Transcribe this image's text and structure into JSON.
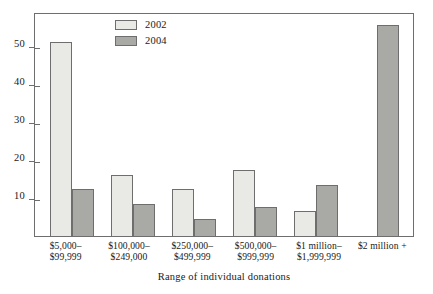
{
  "chart_data": {
    "type": "bar",
    "title": "",
    "xlabel": "Range of individual donations",
    "ylabel": "",
    "categories": [
      "$5,000–$99,999",
      "$100,000–$249,000",
      "$250,000–$499,999",
      "$500,000–$999,999",
      "$1 million–$1,999,999",
      "$2 million +"
    ],
    "category_lines": [
      [
        "$5,000–",
        "$99,999"
      ],
      [
        "$100,000–",
        "$249,000"
      ],
      [
        "$250,000–",
        "$499,999"
      ],
      [
        "$500,000–",
        "$999,999"
      ],
      [
        "$1 million–",
        "$1,999,999"
      ],
      [
        "$2 million +",
        ""
      ]
    ],
    "series": [
      {
        "name": "2002",
        "color": "#e9e9e6",
        "values": [
          51,
          16,
          12.3,
          17.4,
          6.5,
          null
        ]
      },
      {
        "name": "2004",
        "color": "#a9a9a5",
        "values": [
          12.3,
          8.4,
          4.5,
          7.7,
          13.4,
          55.5
        ]
      }
    ],
    "ylim": [
      0,
      59
    ],
    "yticks": [
      10,
      20,
      30,
      40,
      50
    ],
    "ytick_labels": [
      "10",
      "20",
      "30",
      "40",
      "50"
    ],
    "grid": false,
    "legend_position": "upper-center-left"
  },
  "legend": {
    "items": [
      {
        "label": "2002"
      },
      {
        "label": "2004"
      }
    ]
  },
  "axis": {
    "x_title": "Range of individual donations"
  },
  "colors": {
    "series_2002": "#e9e9e6",
    "series_2004": "#a9a9a5",
    "frame": "#6e6e6e",
    "text": "#1a1a1a",
    "background": "#ffffff"
  }
}
